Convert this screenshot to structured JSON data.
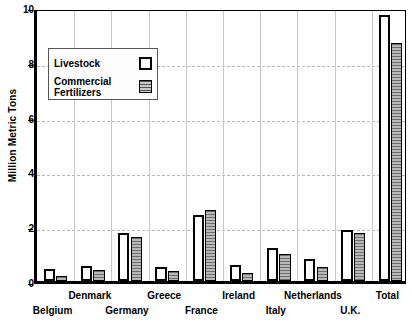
{
  "chart_data": {
    "type": "bar",
    "title": "",
    "xlabel": "",
    "ylabel": "Million Metric Tons",
    "ylim": [
      0,
      10
    ],
    "yticks": [
      0,
      2,
      4,
      6,
      8,
      10
    ],
    "grid": true,
    "legend_position": "upper-left",
    "categories": [
      "Belgium",
      "Denmark",
      "Germany",
      "Greece",
      "France",
      "Ireland",
      "Italy",
      "Netherlands",
      "U.K.",
      "Total"
    ],
    "series": [
      {
        "name": "Livestock",
        "values": [
          0.45,
          0.55,
          1.75,
          0.5,
          2.4,
          0.6,
          1.2,
          0.8,
          1.85,
          9.7
        ]
      },
      {
        "name": "Commercial Fertilizers",
        "values": [
          0.2,
          0.4,
          1.6,
          0.38,
          2.6,
          0.3,
          1.0,
          0.5,
          1.75,
          8.7
        ]
      }
    ]
  },
  "axis": {
    "y_title": "Million Metric Tons",
    "y_tick_labels": [
      "10",
      "8",
      "6",
      "4",
      "2",
      "0"
    ]
  },
  "legend": {
    "items": [
      {
        "label": "Livestock",
        "swatch": "open-box-swatch"
      },
      {
        "label": "Commercial Fertilizers",
        "swatch": "hatched-box-swatch"
      }
    ]
  },
  "colors": {
    "axis": "#000000",
    "livestock_fill": "#ffffff",
    "fertilizer_fill": "#9a9a9a",
    "gridline": "#c8c8c8"
  }
}
